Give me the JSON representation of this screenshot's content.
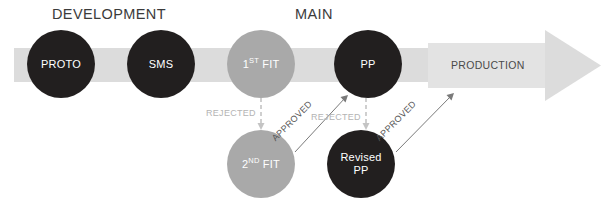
{
  "diagram": {
    "phases": [
      {
        "id": "development",
        "label": "DEVELOPMENT"
      },
      {
        "id": "main",
        "label": "MAIN"
      }
    ],
    "band": {
      "production_label": "PRODUCTION",
      "band_color": "#dcdcdc",
      "block_color": "#e2e2e2"
    },
    "nodes": [
      {
        "id": "proto",
        "label": "PROTO",
        "color": "#221f1f",
        "style": "dark",
        "cx": 61,
        "cy": 64,
        "r": 34
      },
      {
        "id": "sms",
        "label": "SMS",
        "color": "#221f1f",
        "style": "dark",
        "cx": 161,
        "cy": 64,
        "r": 34
      },
      {
        "id": "first-fit",
        "label": "1ST FIT",
        "sup": "ST",
        "pre": "1",
        "post": " FIT",
        "color": "#a9a9a9",
        "style": "light",
        "cx": 261,
        "cy": 64,
        "r": 34
      },
      {
        "id": "pp",
        "label": "PP",
        "color": "#221f1f",
        "style": "dark",
        "cx": 368,
        "cy": 64,
        "r": 34
      },
      {
        "id": "second-fit",
        "label": "2ND FIT",
        "sup": "ND",
        "pre": "2",
        "post": " FIT",
        "color": "#a9a9a9",
        "style": "light",
        "cx": 261,
        "cy": 164,
        "r": 34
      },
      {
        "id": "revised-pp",
        "label": "Revised PP",
        "line1": "Revised",
        "line2": "PP",
        "color": "#221f1f",
        "style": "dark",
        "cx": 361,
        "cy": 164,
        "r": 34
      }
    ],
    "edges": [
      {
        "id": "first-fit-rejected",
        "label": "REJECTED",
        "kind": "rejected",
        "color": "#c4c4c4"
      },
      {
        "id": "second-fit-approved",
        "label": "APPROVED",
        "kind": "approved",
        "color": "#555555"
      },
      {
        "id": "pp-rejected",
        "label": "REJECTED",
        "kind": "rejected",
        "color": "#c4c4c4"
      },
      {
        "id": "revised-pp-approved",
        "label": "APPROVED",
        "kind": "approved",
        "color": "#555555"
      }
    ]
  }
}
